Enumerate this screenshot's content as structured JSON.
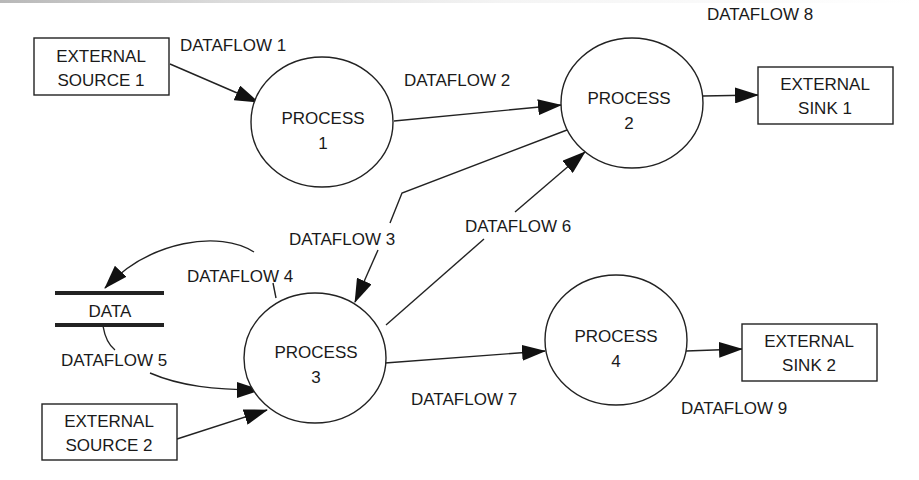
{
  "diagram": {
    "type": "data-flow-diagram",
    "external_entities": [
      {
        "id": "es1",
        "lines": [
          "EXTERNAL",
          "SOURCE 1"
        ]
      },
      {
        "id": "es2",
        "lines": [
          "EXTERNAL",
          "SOURCE 2"
        ]
      },
      {
        "id": "ek1",
        "lines": [
          "EXTERNAL",
          "SINK 1"
        ]
      },
      {
        "id": "ek2",
        "lines": [
          "EXTERNAL",
          "SINK 2"
        ]
      }
    ],
    "processes": [
      {
        "id": "p1",
        "lines": [
          "PROCESS",
          "1"
        ]
      },
      {
        "id": "p2",
        "lines": [
          "PROCESS",
          "2"
        ]
      },
      {
        "id": "p3",
        "lines": [
          "PROCESS",
          "3"
        ]
      },
      {
        "id": "p4",
        "lines": [
          "PROCESS",
          "4"
        ]
      }
    ],
    "data_store": {
      "label": "DATA"
    },
    "dataflows": [
      {
        "label": "DATAFLOW 1",
        "from": "EXTERNAL SOURCE 1",
        "to": "PROCESS 1"
      },
      {
        "label": "DATAFLOW 2",
        "from": "PROCESS 1",
        "to": "PROCESS 2"
      },
      {
        "label": "DATAFLOW 3",
        "from": "PROCESS 2",
        "to": "PROCESS 3"
      },
      {
        "label": "DATAFLOW 4",
        "from": "PROCESS 3",
        "to": "DATA"
      },
      {
        "label": "DATAFLOW 5",
        "from": "DATA",
        "to": "PROCESS 3"
      },
      {
        "label": "DATAFLOW 6",
        "from": "PROCESS 3",
        "to": "PROCESS 2"
      },
      {
        "label": "DATAFLOW 7",
        "from": "PROCESS 3",
        "to": "PROCESS 4"
      },
      {
        "label": "DATAFLOW 8",
        "from": "PROCESS 2",
        "to": "EXTERNAL SINK 1"
      },
      {
        "label": "DATAFLOW 9",
        "from": "PROCESS 4",
        "to": "EXTERNAL SINK 2"
      }
    ]
  }
}
